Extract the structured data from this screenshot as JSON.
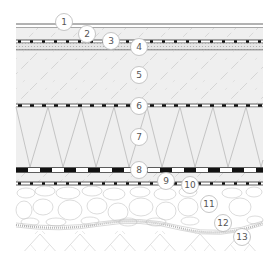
{
  "diagram": {
    "type": "construction-layer-section",
    "colors": {
      "background": "#ffffff",
      "layer_fill": "#efefef",
      "hatch": "#c8c8c8",
      "line": "#3a3a3a",
      "membrane_dark": "#111111",
      "callout_stroke": "#b8b8b8",
      "callout_text": "#555555"
    },
    "callouts": [
      {
        "label": "1",
        "cx": 64,
        "cy": 22
      },
      {
        "label": "2",
        "cx": 87,
        "cy": 34
      },
      {
        "label": "3",
        "cx": 111,
        "cy": 41
      },
      {
        "label": "4",
        "cx": 139,
        "cy": 47
      },
      {
        "label": "5",
        "cx": 139,
        "cy": 75
      },
      {
        "label": "6",
        "cx": 139,
        "cy": 106
      },
      {
        "label": "7",
        "cx": 139,
        "cy": 137
      },
      {
        "label": "8",
        "cx": 139,
        "cy": 170
      },
      {
        "label": "9",
        "cx": 166,
        "cy": 181
      },
      {
        "label": "10",
        "cx": 190,
        "cy": 185
      },
      {
        "label": "11",
        "cx": 209,
        "cy": 204
      },
      {
        "label": "12",
        "cx": 223,
        "cy": 223
      },
      {
        "label": "13",
        "cx": 242,
        "cy": 237
      }
    ]
  }
}
